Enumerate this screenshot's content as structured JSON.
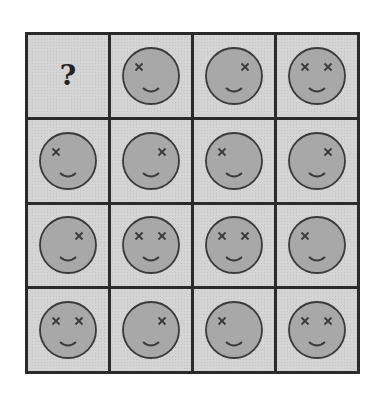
{
  "puzzle": {
    "rows": 4,
    "cols": 4,
    "missing_symbol": "?",
    "colors": {
      "grid_line": "#2a2a2a",
      "cell_bg": "#d4d4d4",
      "face_fill": "#a8a8a8",
      "face_stroke": "#3a3a3a"
    },
    "cells": [
      {
        "type": "missing",
        "label": "?"
      },
      {
        "type": "face",
        "left_x": true,
        "right_x": false
      },
      {
        "type": "face",
        "left_x": false,
        "right_x": true
      },
      {
        "type": "face",
        "left_x": true,
        "right_x": true
      },
      {
        "type": "face",
        "left_x": true,
        "right_x": false
      },
      {
        "type": "face",
        "left_x": false,
        "right_x": true
      },
      {
        "type": "face",
        "left_x": true,
        "right_x": false
      },
      {
        "type": "face",
        "left_x": false,
        "right_x": true
      },
      {
        "type": "face",
        "left_x": false,
        "right_x": true
      },
      {
        "type": "face",
        "left_x": true,
        "right_x": true
      },
      {
        "type": "face",
        "left_x": true,
        "right_x": true
      },
      {
        "type": "face",
        "left_x": true,
        "right_x": false
      },
      {
        "type": "face",
        "left_x": true,
        "right_x": true
      },
      {
        "type": "face",
        "left_x": false,
        "right_x": true
      },
      {
        "type": "face",
        "left_x": true,
        "right_x": false
      },
      {
        "type": "face",
        "left_x": true,
        "right_x": true
      }
    ]
  }
}
